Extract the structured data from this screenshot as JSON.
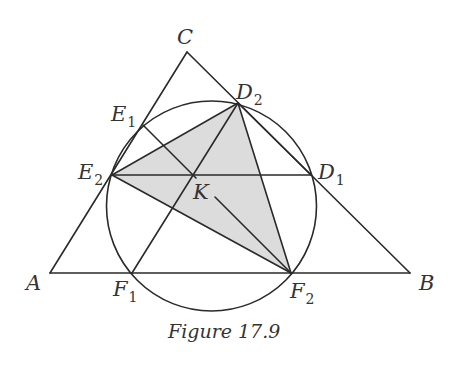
{
  "figure": {
    "caption": "Figure 17.9",
    "colors": {
      "line": "#2a2a2a",
      "shade": "#dcdcdc",
      "text": "#333333",
      "background": "#ffffff"
    },
    "points": {
      "A": {
        "label": "A",
        "sub": "",
        "x": 50,
        "y": 273
      },
      "B": {
        "label": "B",
        "sub": "",
        "x": 410,
        "y": 273
      },
      "C": {
        "label": "C",
        "sub": "",
        "x": 187,
        "y": 52
      },
      "D1": {
        "label": "D",
        "sub": "1",
        "x": 311,
        "y": 175
      },
      "D2": {
        "label": "D",
        "sub": "2",
        "x": 238,
        "y": 103
      },
      "E1": {
        "label": "E",
        "sub": "1",
        "x": 143,
        "y": 125
      },
      "E2": {
        "label": "E",
        "sub": "2",
        "x": 112,
        "y": 175
      },
      "F1": {
        "label": "F",
        "sub": "1",
        "x": 132,
        "y": 273
      },
      "F2": {
        "label": "F",
        "sub": "2",
        "x": 291,
        "y": 273
      },
      "K": {
        "label": "K",
        "sub": "",
        "x": 193,
        "y": 175
      }
    },
    "circle": {
      "cx": 211.5,
      "cy": 206,
      "r": 105
    },
    "shaded_triangle": [
      "E2",
      "D2",
      "F2"
    ]
  }
}
